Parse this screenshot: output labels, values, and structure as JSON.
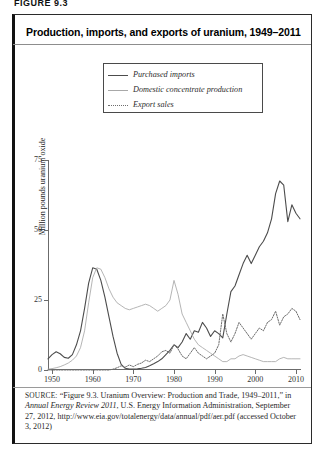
{
  "figure_number": "FIGURE 9.3",
  "title": "Production, imports, and exports of uranium, 1949–2011",
  "legend": {
    "position": "top-center-right",
    "items": [
      {
        "label": "Purchased imports",
        "style": "solid-thick",
        "color": "#4c4c4c",
        "icon": "line-swatch-icon"
      },
      {
        "label": "Domestic concentrate production",
        "style": "solid-thin",
        "color": "#a8a8a8",
        "icon": "line-swatch-icon"
      },
      {
        "label": "Export sales",
        "style": "dotted",
        "color": "#6e6e6e",
        "icon": "dotted-line-swatch-icon"
      }
    ]
  },
  "source": {
    "prefix": "SOURCE:",
    "text_1": " “Figure 9.3. Uranium Overview: Production and Trade, 1949–2011,” in ",
    "italic_1": "Annual Energy Review 2011",
    "text_2": ", U.S. Energy Information Administration, September 27, 2012, http://www.eia.gov/totalenergy/data/annual/pdf/aer.pdf (accessed October 3, 2012)"
  },
  "chart_data": {
    "type": "line",
    "title": "Production, imports, and exports of uranium, 1949–2011",
    "xlabel": "",
    "ylabel": "Million pounds uranium oxide",
    "xlim": [
      1949,
      2011
    ],
    "ylim": [
      0,
      75
    ],
    "yticks": [
      0,
      25,
      50,
      75
    ],
    "xticks": [
      1950,
      1960,
      1970,
      1980,
      1990,
      2000,
      2010
    ],
    "grid": false,
    "legend_position": "upper center",
    "x": [
      1949,
      1950,
      1951,
      1952,
      1953,
      1954,
      1955,
      1956,
      1957,
      1958,
      1959,
      1960,
      1961,
      1962,
      1963,
      1964,
      1965,
      1966,
      1967,
      1968,
      1969,
      1970,
      1971,
      1972,
      1973,
      1974,
      1975,
      1976,
      1977,
      1978,
      1979,
      1980,
      1981,
      1982,
      1983,
      1984,
      1985,
      1986,
      1987,
      1988,
      1989,
      1990,
      1991,
      1992,
      1993,
      1994,
      1995,
      1996,
      1997,
      1998,
      1999,
      2000,
      2001,
      2002,
      2003,
      2004,
      2005,
      2006,
      2007,
      2008,
      2009,
      2010,
      2011
    ],
    "series": [
      {
        "name": "Purchased imports",
        "style": "solid-thick",
        "color": "#4c4c4c",
        "values": [
          4.0,
          5.5,
          6.5,
          5.8,
          4.5,
          4.2,
          5.5,
          9.0,
          14.0,
          22.0,
          31.0,
          36.5,
          36.0,
          32.0,
          26.0,
          19.0,
          12.0,
          6.0,
          2.0,
          0.6,
          0.3,
          0.3,
          0.4,
          0.6,
          0.9,
          1.5,
          2.2,
          3.0,
          4.0,
          5.5,
          7.0,
          9.0,
          8.0,
          10.0,
          13.0,
          11.0,
          14.0,
          13.5,
          17.0,
          15.0,
          12.0,
          14.0,
          13.0,
          11.5,
          20.0,
          28.0,
          30.0,
          34.0,
          38.0,
          41.0,
          38.0,
          41.0,
          44.0,
          46.0,
          49.0,
          54.0,
          63.0,
          67.5,
          66.0,
          53.0,
          59.0,
          56.0,
          54.0
        ]
      },
      {
        "name": "Domestic concentrate production",
        "style": "solid-thin",
        "color": "#a8a8a8",
        "values": [
          0.3,
          0.5,
          0.8,
          1.2,
          1.8,
          2.5,
          3.5,
          5.0,
          8.0,
          14.0,
          24.0,
          33.0,
          36.5,
          36.0,
          33.0,
          29.0,
          26.0,
          24.0,
          23.0,
          22.0,
          21.5,
          22.0,
          22.5,
          23.0,
          23.5,
          23.0,
          22.0,
          21.0,
          22.0,
          23.0,
          25.0,
          32.0,
          27.0,
          20.0,
          17.0,
          14.0,
          11.0,
          9.0,
          8.0,
          7.0,
          6.0,
          5.0,
          4.0,
          3.0,
          3.0,
          4.0,
          4.0,
          5.0,
          5.5,
          5.0,
          4.5,
          4.0,
          3.5,
          3.0,
          3.0,
          3.0,
          3.0,
          4.0,
          4.5,
          4.0,
          4.0,
          4.0,
          4.0
        ]
      },
      {
        "name": "Export sales",
        "style": "dotted",
        "color": "#6e6e6e",
        "values": [
          0.0,
          0.0,
          0.0,
          0.0,
          0.0,
          0.0,
          0.0,
          0.0,
          0.0,
          0.0,
          0.0,
          0.0,
          0.0,
          0.0,
          0.0,
          0.0,
          0.3,
          0.8,
          1.5,
          1.0,
          1.8,
          1.2,
          2.0,
          2.5,
          3.5,
          3.0,
          4.0,
          5.0,
          6.5,
          7.0,
          6.0,
          9.0,
          7.5,
          5.0,
          4.0,
          6.0,
          8.0,
          6.0,
          5.0,
          4.0,
          5.0,
          6.0,
          9.0,
          20.0,
          13.0,
          10.0,
          13.0,
          17.0,
          15.0,
          13.0,
          11.0,
          13.0,
          15.0,
          14.0,
          17.0,
          18.0,
          21.0,
          16.0,
          19.0,
          20.0,
          22.0,
          21.0,
          18.0
        ]
      }
    ]
  }
}
